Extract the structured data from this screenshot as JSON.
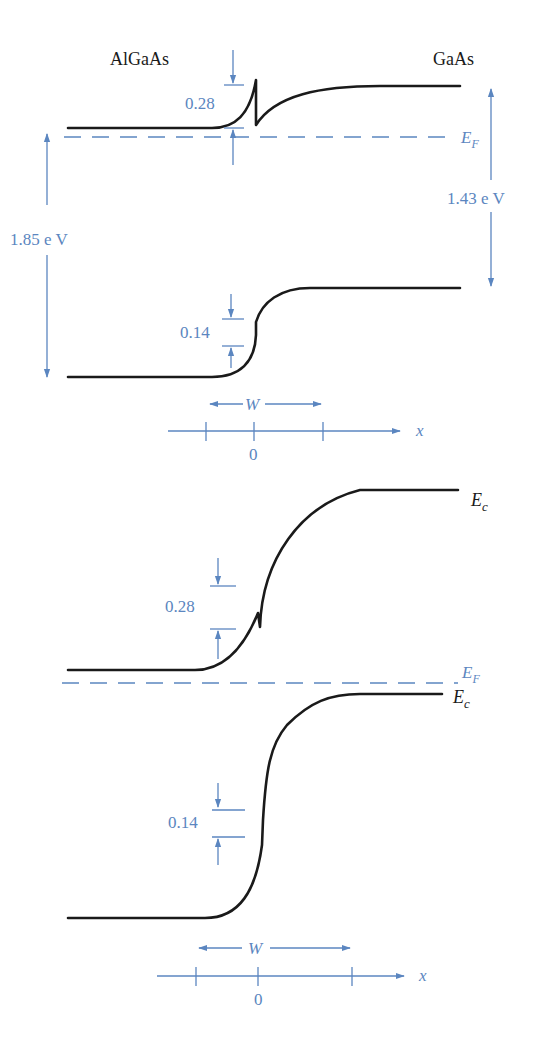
{
  "figure": {
    "top_panel": {
      "material_left": "AlGaAs",
      "material_right": "GaAs",
      "conduction_offset": "0.28",
      "valence_offset": "0.14",
      "bandgap_left": "1.85  e V",
      "bandgap_right": "1.43  e V",
      "fermi_label": "E",
      "fermi_sub": "F",
      "width_label": "W",
      "axis_label": "x",
      "axis_origin": "0"
    },
    "bottom_panel": {
      "conduction_label_1": "E",
      "conduction_sub_1": "c",
      "conduction_label_2": "E",
      "conduction_sub_2": "c",
      "conduction_offset": "0.28",
      "valence_offset": "0.14",
      "fermi_label": "E",
      "fermi_sub": "F",
      "width_label": "W",
      "axis_label": "x",
      "axis_origin": "0"
    }
  },
  "colors": {
    "band_line": "#1a1a1a",
    "annotation": "#5b86c0"
  }
}
